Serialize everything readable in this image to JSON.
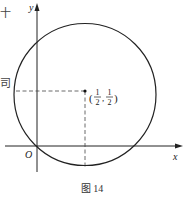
{
  "figure": {
    "caption": "图 14",
    "axes": {
      "x_label": "x",
      "y_label": "y",
      "origin_label": "O"
    },
    "circle": {
      "center_label_prefix": "(",
      "center_x_num": "1",
      "center_x_den": "2",
      "separator": ",",
      "center_y_num": "1",
      "center_y_den": "2",
      "center_label_suffix": ")",
      "center": [
        0.5,
        0.5
      ],
      "radius_units": "√2/2"
    },
    "edge_fragments": {
      "top": "十",
      "middle": "司"
    },
    "colors": {
      "stroke": "#222222",
      "background": "#ffffff"
    }
  }
}
